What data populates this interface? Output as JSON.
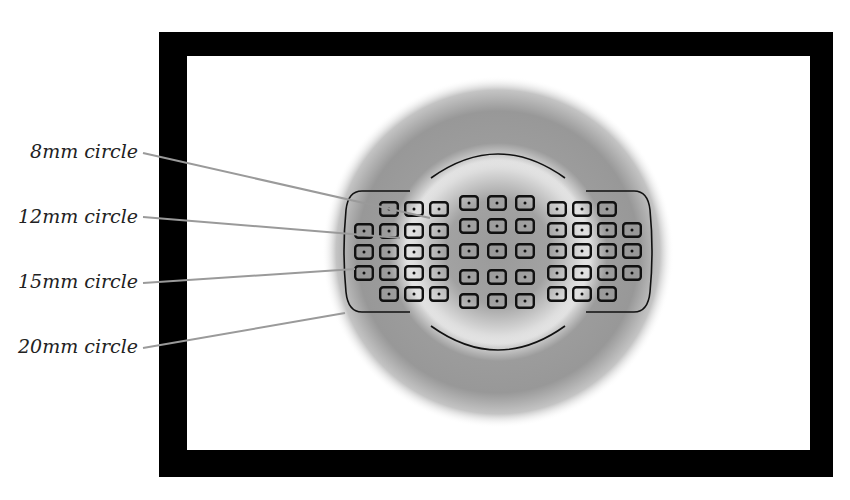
{
  "frame": {
    "outer": [
      159,
      32,
      833,
      477
    ],
    "inner": [
      187,
      56,
      810,
      450
    ],
    "color": "#000000"
  },
  "metering": {
    "center": [
      498,
      252
    ],
    "outer_radius": 176,
    "inner_clear_radius": 92,
    "colors": {
      "dark": "#8a8a8a",
      "light": "#f2f2f2"
    }
  },
  "labels": [
    {
      "text": "8mm circle",
      "y": 157,
      "line": [
        143,
        153,
        430,
        218
      ]
    },
    {
      "text": "12mm circle",
      "y": 222,
      "line": [
        143,
        217,
        400,
        238
      ]
    },
    {
      "text": "15mm circle",
      "y": 287,
      "line": [
        143,
        283,
        355,
        269
      ]
    },
    {
      "text": "20mm circle",
      "y": 352,
      "line": [
        143,
        348,
        345,
        313
      ]
    }
  ],
  "leader_color": "#9a9a9a",
  "af_points": {
    "box_w": 20,
    "box_h": 16,
    "left_cluster": {
      "cols": [
        354,
        379,
        404,
        429
      ],
      "rows": [
        201,
        223,
        244,
        265,
        286
      ],
      "layout": [
        [
          0,
          1,
          1,
          1
        ],
        [
          1,
          1,
          1,
          1
        ],
        [
          1,
          1,
          1,
          1
        ],
        [
          1,
          1,
          1,
          1
        ],
        [
          0,
          1,
          1,
          1
        ]
      ]
    },
    "center_cluster": {
      "cols": [
        459,
        487,
        515
      ],
      "rows": [
        195,
        218,
        243,
        269,
        293
      ],
      "layout": [
        [
          1,
          1,
          1
        ],
        [
          1,
          1,
          1
        ],
        [
          1,
          1,
          1
        ],
        [
          1,
          1,
          1
        ],
        [
          1,
          1,
          1
        ]
      ]
    },
    "right_cluster": {
      "cols": [
        547,
        572,
        597,
        622
      ],
      "rows": [
        201,
        222,
        243,
        265,
        286
      ],
      "layout": [
        [
          1,
          1,
          1,
          0
        ],
        [
          1,
          1,
          1,
          1
        ],
        [
          1,
          1,
          1,
          1
        ],
        [
          1,
          1,
          1,
          1
        ],
        [
          1,
          1,
          1,
          0
        ]
      ]
    }
  }
}
